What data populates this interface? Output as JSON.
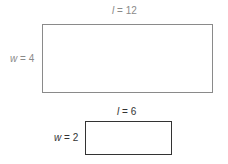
{
  "diagram": {
    "type": "similar-rectangles",
    "rectangles": [
      {
        "id": "large",
        "length_var": "l",
        "length_value": "12",
        "width_var": "w",
        "width_value": "4",
        "length_label": "l = 12",
        "width_label": "w = 4",
        "stroke_color": "#8a8a8a",
        "label_color": "#8a8a8a"
      },
      {
        "id": "small",
        "length_var": "l",
        "length_value": "6",
        "width_var": "w",
        "width_value": "2",
        "length_label": "l = 6",
        "width_label": "w = 2",
        "stroke_color": "#333333",
        "label_color": "#333333"
      }
    ]
  }
}
